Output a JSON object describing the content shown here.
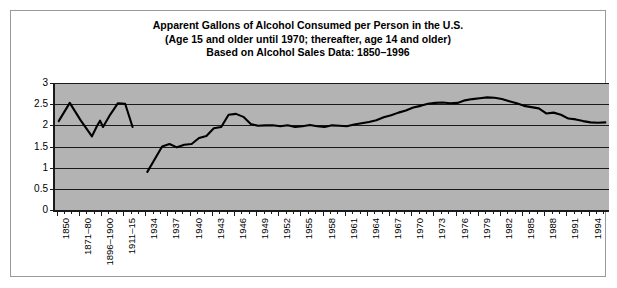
{
  "figure": {
    "border_color": "#9a9a9a",
    "plot_bg_color": "#b3b3b3",
    "line_color": "#000000"
  },
  "title": {
    "line1": "Apparent Gallons of Alcohol Consumed per Person in the U.S.",
    "line2": "(Age 15 and older until 1970; thereafter, age 14 and older)",
    "line3": "Based on Alcohol Sales Data: 1850–1996"
  },
  "chart_data": {
    "type": "line",
    "title": "Apparent Gallons of Alcohol Consumed per Person in the U.S. (Age 15 and older until 1970; thereafter, age 14 and older) Based on Alcohol Sales Data: 1850–1996",
    "xlabel": "",
    "ylabel": "",
    "ylim": [
      0,
      3
    ],
    "yticks": [
      0,
      0.5,
      1,
      1.5,
      2,
      2.5,
      3
    ],
    "ytick_labels": [
      "0",
      "0.5",
      "1",
      "1.5",
      "2",
      "2.5",
      "3"
    ],
    "grid": true,
    "legend": "none",
    "xtick_labels": [
      "1850",
      "1871–80",
      "1896–1900",
      "1911–15",
      "1934",
      "1937",
      "1940",
      "1943",
      "1946",
      "1949",
      "1952",
      "1955",
      "1958",
      "1961",
      "1964",
      "1967",
      "1970",
      "1973",
      "1976",
      "1979",
      "1982",
      "1985",
      "1988",
      "1991",
      "1994"
    ],
    "xtick_label_positions": [
      0,
      3,
      6,
      9,
      12,
      15,
      18,
      21,
      24,
      27,
      30,
      33,
      36,
      39,
      42,
      45,
      48,
      51,
      54,
      57,
      60,
      63,
      66,
      69,
      72
    ],
    "note": "Gap in the series corresponds to Prohibition (no sales data).",
    "series": [
      {
        "name": "Gallons of alcohol per person",
        "segment": "pre-prohibition",
        "x": [
          "1850",
          "1860",
          "1871–80",
          "1881–85",
          "1886–90",
          "1891–95",
          "1896–1900",
          "1901–05",
          "1906–10",
          "1911–15",
          "1916–19"
        ],
        "values": [
          2.1,
          2.53,
          2.11,
          1.74,
          1.99,
          2.11,
          1.96,
          2.26,
          2.52,
          2.51,
          1.96
        ]
      },
      {
        "name": "Gallons of alcohol per person",
        "segment": "post-prohibition",
        "x": [
          "1934",
          "1935",
          "1936",
          "1937",
          "1938",
          "1939",
          "1940",
          "1941",
          "1942",
          "1943",
          "1944",
          "1945",
          "1946",
          "1947",
          "1948",
          "1949",
          "1950",
          "1951",
          "1952",
          "1953",
          "1954",
          "1955",
          "1956",
          "1957",
          "1958",
          "1959",
          "1960",
          "1961",
          "1962",
          "1963",
          "1964",
          "1965",
          "1966",
          "1967",
          "1968",
          "1969",
          "1970",
          "1971",
          "1972",
          "1973",
          "1974",
          "1975",
          "1976",
          "1977",
          "1978",
          "1979",
          "1980",
          "1981",
          "1982",
          "1983",
          "1984",
          "1985",
          "1986",
          "1987",
          "1988",
          "1989",
          "1990",
          "1991",
          "1992",
          "1993",
          "1994",
          "1995",
          "1996"
        ],
        "values": [
          0.9,
          1.2,
          1.5,
          1.56,
          1.48,
          1.54,
          1.56,
          1.7,
          1.75,
          1.93,
          1.96,
          2.25,
          2.27,
          2.2,
          2.03,
          1.99,
          2.0,
          2.0,
          1.98,
          2.0,
          1.96,
          1.98,
          2.01,
          1.98,
          1.96,
          2.0,
          1.99,
          1.98,
          2.02,
          2.05,
          2.08,
          2.12,
          2.19,
          2.24,
          2.3,
          2.35,
          2.42,
          2.46,
          2.51,
          2.53,
          2.54,
          2.52,
          2.53,
          2.59,
          2.62,
          2.64,
          2.66,
          2.65,
          2.62,
          2.57,
          2.52,
          2.46,
          2.43,
          2.4,
          2.28,
          2.3,
          2.25,
          2.16,
          2.14,
          2.1,
          2.07,
          2.06,
          2.07
        ]
      }
    ]
  }
}
